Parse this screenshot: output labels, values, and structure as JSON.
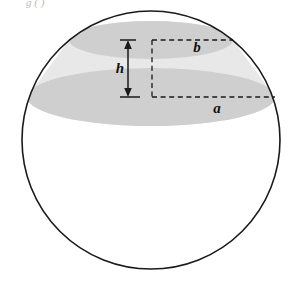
{
  "figure": {
    "kind": "geometry-diagram",
    "width": 296,
    "height": 286,
    "background_color": "#ffffff"
  },
  "colors": {
    "page_background": "#ffffff",
    "sphere_outline": "#1a1a1a",
    "sphere_fill": "#ffffff",
    "cap_ellipse_fill": "#cfcfcf",
    "zone_band_fill": "#e8e8e8",
    "dashed_line": "#1a1a1a",
    "arrow": "#1a1a1a",
    "label_text": "#111111",
    "clipped_header_text": "#b9b9b9"
  },
  "geometry": {
    "sphere": {
      "center_x": 151,
      "center_y": 140,
      "radius": 129,
      "stroke_width": 1.6
    },
    "upper_ellipse": {
      "label": "b",
      "center_x": 151,
      "center_y": 40,
      "radius_x": 82,
      "radius_y": 19
    },
    "lower_ellipse": {
      "label": "a",
      "center_x": 151,
      "center_y": 97,
      "radius_x": 124,
      "radius_y": 29
    },
    "height_arrow": {
      "label": "h",
      "x": 128,
      "y_top": 40,
      "y_bottom": 97,
      "cap_half_width": 8
    },
    "dashed_vertical_axis": {
      "x": 152,
      "y_top": 40,
      "y_bottom": 98
    },
    "dashed_radius_b": {
      "y": 40,
      "x_start": 152,
      "x_end": 233
    },
    "dashed_radius_a": {
      "y": 97,
      "x_start": 152,
      "x_end": 275
    }
  },
  "labels": {
    "radius_top": "b",
    "radius_bottom": "a",
    "height": "h"
  },
  "label_positions": {
    "radius_top": {
      "x": 197,
      "y": 52,
      "font_size": 15
    },
    "radius_bottom": {
      "x": 217,
      "y": 113,
      "font_size": 15
    },
    "height": {
      "x": 120,
      "y": 73,
      "font_size": 15
    }
  },
  "clipped_header": {
    "text": "g ( )",
    "x": 26,
    "y": 6
  }
}
